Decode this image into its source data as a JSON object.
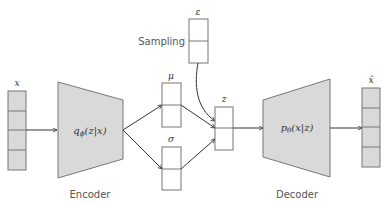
{
  "diagram": {
    "colors": {
      "fill_gray": "#d9d9d9",
      "stroke": "#777777",
      "arrow": "#333333",
      "box_fill": "#ffffff"
    },
    "input": {
      "label": "x",
      "cells": 4
    },
    "encoder": {
      "formula": "qϕ(z|x)",
      "formula_main": "q",
      "formula_sub": "ϕ",
      "formula_args": "(z|x)",
      "caption": "Encoder"
    },
    "mu": {
      "label": "μ",
      "cells": 2
    },
    "sigma": {
      "label": "σ",
      "cells": 2
    },
    "epsilon": {
      "label": "ε",
      "cells": 2,
      "caption": "Sampling"
    },
    "latent": {
      "label": "z",
      "cells": 2
    },
    "decoder": {
      "formula": "pθ(x|z)",
      "formula_main": "p",
      "formula_sub": "θ",
      "formula_args": "(x|z)",
      "caption": "Decoder"
    },
    "output": {
      "label": "x̂",
      "cells": 4
    }
  }
}
